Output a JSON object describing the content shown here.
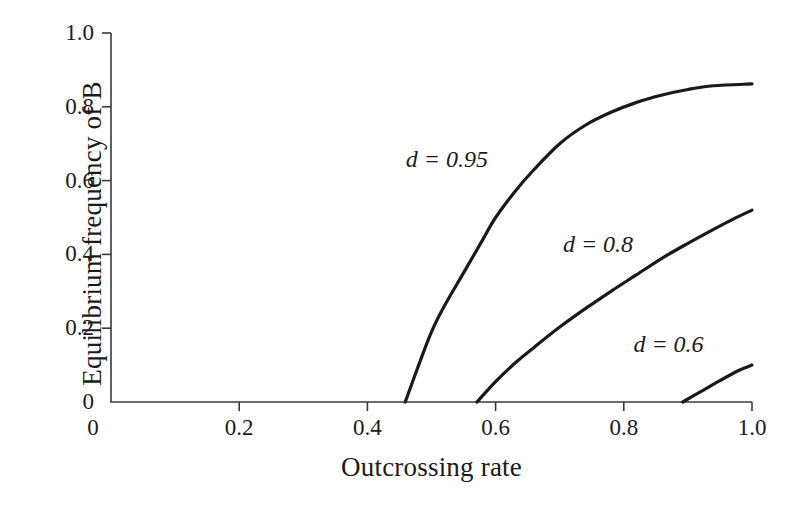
{
  "chart_data": {
    "type": "line",
    "title": "",
    "xlabel": "Outcrossing rate",
    "ylabel": "Equilibrium frequency of B",
    "xlim": [
      0,
      1.0
    ],
    "ylim": [
      0,
      1.0
    ],
    "grid": false,
    "legend": "inline-annotations",
    "xticks": [
      "0",
      "0.2",
      "0.4",
      "0.6",
      "0.8",
      "1.0"
    ],
    "xtick_values": [
      0,
      0.2,
      0.4,
      0.6,
      0.8,
      1.0
    ],
    "yticks": [
      "0",
      "0.2",
      "0.4",
      "0.6",
      "0.8",
      "1.0"
    ],
    "ytick_values": [
      0,
      0.2,
      0.4,
      0.6,
      0.8,
      1.0
    ],
    "line_color": "#1a1a1a",
    "axis_color": "#3a3a3a",
    "background": "#ffffff",
    "series": [
      {
        "name": "d = 0.95",
        "label": "d = 0.95",
        "d": 0.95,
        "threshold": 0.459,
        "label_x": 0.46,
        "label_y": 0.655,
        "x": [
          0.459,
          0.48,
          0.5,
          0.52,
          0.55,
          0.58,
          0.6,
          0.63,
          0.66,
          0.7,
          0.74,
          0.78,
          0.82,
          0.86,
          0.9,
          0.94,
          1.0
        ],
        "y": [
          0.0,
          0.1,
          0.19,
          0.26,
          0.35,
          0.44,
          0.5,
          0.57,
          0.63,
          0.7,
          0.75,
          0.785,
          0.812,
          0.832,
          0.847,
          0.857,
          0.862
        ]
      },
      {
        "name": "d = 0.8",
        "label": "d = 0.8",
        "d": 0.8,
        "threshold": 0.571,
        "label_x": 0.705,
        "label_y": 0.425,
        "x": [
          0.571,
          0.6,
          0.63,
          0.66,
          0.7,
          0.74,
          0.78,
          0.82,
          0.86,
          0.9,
          0.94,
          0.97,
          1.0
        ],
        "y": [
          0.0,
          0.055,
          0.105,
          0.148,
          0.203,
          0.253,
          0.3,
          0.345,
          0.39,
          0.43,
          0.468,
          0.495,
          0.52
        ]
      },
      {
        "name": "d = 0.6",
        "label": "d = 0.6",
        "d": 0.6,
        "threshold": 0.892,
        "label_x": 0.815,
        "label_y": 0.155,
        "x": [
          0.892,
          0.92,
          0.95,
          0.98,
          1.0
        ],
        "y": [
          0.0,
          0.028,
          0.058,
          0.086,
          0.1
        ]
      }
    ]
  }
}
